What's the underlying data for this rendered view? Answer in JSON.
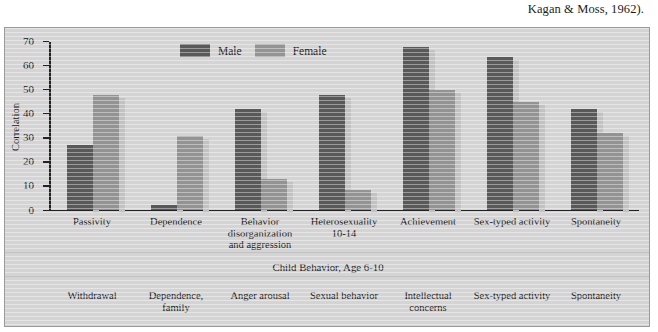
{
  "caption": "Kagan & Moss, 1962).",
  "legend": {
    "items": [
      {
        "label": "Male",
        "color": "#595959",
        "key": "male"
      },
      {
        "label": "Female",
        "color": "#939393",
        "key": "female"
      }
    ]
  },
  "axis": {
    "ylabel": "Correlation",
    "ticks": [
      "70",
      "60",
      "50",
      "40",
      "30",
      "20",
      "10",
      "0"
    ]
  },
  "sections": {
    "child_caption": "Child Behavior, Age 6-10",
    "adult_caption": "Adult Behavior"
  },
  "child_labels": [
    "Passivity",
    "Dependence",
    "Behavior disorganization and aggression",
    "Heterosexuality 10-14",
    "Achievement",
    "Sex-typed activity",
    "Spontaneity"
  ],
  "adult_labels": [
    "Withdrawal",
    "Dependence, family",
    "Anger arousal",
    "Sexual behavior",
    "Intellectual concerns",
    "Sex-typed activity",
    "Spontaneity"
  ],
  "chart_data": {
    "type": "bar",
    "title": "",
    "xlabel": "Child Behavior, Age 6-10",
    "ylabel": "Correlation",
    "ylim": [
      0,
      70
    ],
    "yticks": [
      0,
      10,
      20,
      30,
      40,
      50,
      60,
      70
    ],
    "grid": false,
    "legend_position": "top-center",
    "categories": [
      "Passivity",
      "Dependence",
      "Behavior disorganization and aggression",
      "Heterosexuality 10-14",
      "Achievement",
      "Sex-typed activity",
      "Spontaneity"
    ],
    "categories_adult": [
      "Withdrawal",
      "Dependence, family",
      "Anger arousal",
      "Sexual behavior",
      "Intellectual concerns",
      "Sex-typed activity",
      "Spontaneity"
    ],
    "series": [
      {
        "name": "Male",
        "color": "#595959",
        "values": [
          27,
          2,
          42,
          48,
          68,
          64,
          42
        ]
      },
      {
        "name": "Female",
        "color": "#939393",
        "values": [
          48,
          31,
          13,
          8,
          50,
          45,
          32
        ]
      }
    ]
  }
}
